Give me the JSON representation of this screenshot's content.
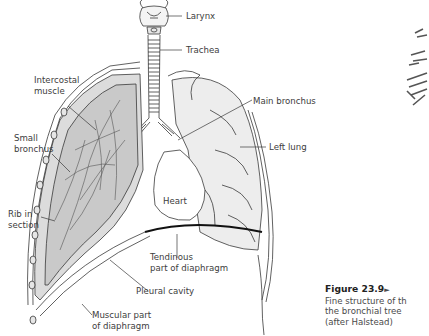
{
  "diagram": {
    "labels": {
      "larynx": "Larynx",
      "trachea": "Trachea",
      "intercostal_muscle_line1": "Intercostal",
      "intercostal_muscle_line2": "muscle",
      "main_bronchus": "Main bronchus",
      "small_bronchus_line1": "Small",
      "small_bronchus_line2": "bronchus",
      "left_lung": "Left lung",
      "heart": "Heart",
      "rib_line1": "Rib in",
      "rib_line2": "section",
      "tendinous_line1": "Tendinous",
      "tendinous_line2": "part of diaphragm",
      "pleural_cavity": "Pleural cavity",
      "muscular_line1": "Muscular part",
      "muscular_line2": "of diaphragm"
    },
    "caption": {
      "figure_number": "Figure 23.9",
      "arrow": "►",
      "line1": "Fine structure of th",
      "line2": "the bronchial tree",
      "line3": "(after Halstead)"
    },
    "colors": {
      "line": "#3a3a3a",
      "lung_fill": "#ececec",
      "diaphragm_tendon": "#111111",
      "text": "#3d3d3d"
    }
  }
}
